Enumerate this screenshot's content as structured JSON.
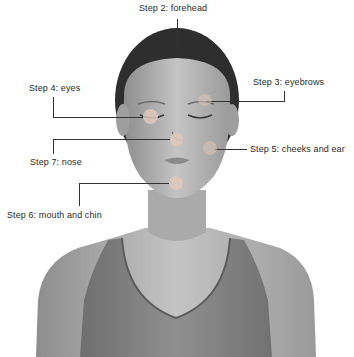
{
  "figure": {
    "type": "face-massage-steps-diagram",
    "image_subject": "woman with eyes closed, grayscale photo",
    "steps": [
      {
        "id": 2,
        "label": "Step 2: forehead"
      },
      {
        "id": 3,
        "label": "Step 3: eyebrows"
      },
      {
        "id": 4,
        "label": "Step 4: eyes"
      },
      {
        "id": 5,
        "label": "Step 5: cheeks and ear"
      },
      {
        "id": 6,
        "label": "Step 6: mouth and chin"
      },
      {
        "id": 7,
        "label": "Step 7: nose"
      }
    ]
  },
  "colors": {
    "background": "#ffffff",
    "line": "#333333",
    "dot": "#e6cfc6",
    "text": "#2a2a2a"
  }
}
